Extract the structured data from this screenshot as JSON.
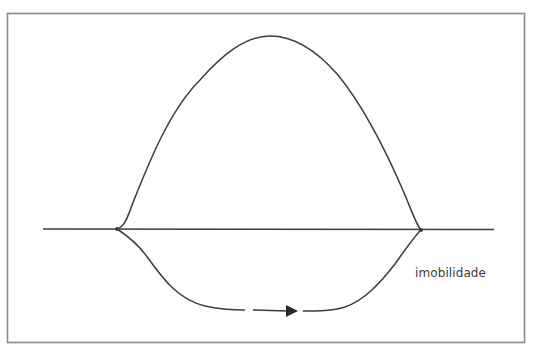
{
  "figure": {
    "frame": {
      "x": 7,
      "y": 13,
      "width": 517,
      "height": 329,
      "stroke": "#8a8a8a"
    },
    "line_color": "#3c3c3c",
    "baseline": {
      "x1": 43,
      "y": 229,
      "x2": 494
    },
    "nodes": [
      {
        "x": 117,
        "y": 229
      },
      {
        "x": 421,
        "y": 230
      }
    ],
    "upper_curve": {
      "peak_x": 270,
      "peak_y": 36
    },
    "lower_curve": {
      "bottom_y": 310
    },
    "arrow": {
      "direction": "right",
      "dash_from_x": 253,
      "tip_x": 298
    },
    "label": {
      "text": "imobilidade",
      "x": 415,
      "y": 275
    }
  }
}
